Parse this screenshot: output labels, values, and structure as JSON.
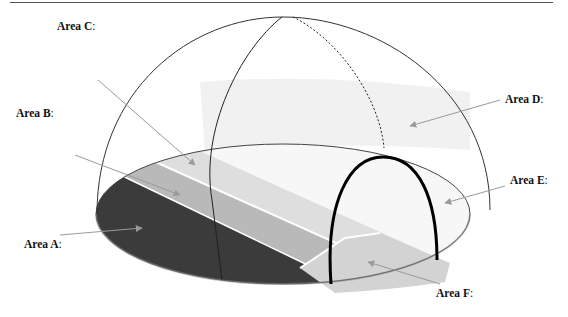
{
  "figure": {
    "type": "hemispherical sky dome diagram",
    "labels": [
      {
        "id": "A",
        "text": "Area A",
        "suffix": ":",
        "x": 24,
        "y": 239
      },
      {
        "id": "B",
        "text": "Area B",
        "suffix": ":",
        "x": 16,
        "y": 108
      },
      {
        "id": "C",
        "text": "Area C",
        "suffix": ":",
        "x": 57,
        "y": 26
      },
      {
        "id": "D",
        "text": "Area D",
        "suffix": ":",
        "x": 505,
        "y": 95
      },
      {
        "id": "E",
        "text": "Area E",
        "suffix": ":",
        "x": 510,
        "y": 175
      },
      {
        "id": "F",
        "text": "Area F",
        "suffix": ":",
        "x": 436,
        "y": 288
      }
    ],
    "colors": {
      "area_a": "#3a3a3a",
      "area_b": "#b4b4b4",
      "area_c": "#dcdcdc",
      "area_d": "#f0f0f0",
      "area_e": "#f7f7f7",
      "area_f": "#d2d2d2",
      "outline": "#333333",
      "arrow": "#9a9a9a",
      "arch": "#000000"
    }
  }
}
